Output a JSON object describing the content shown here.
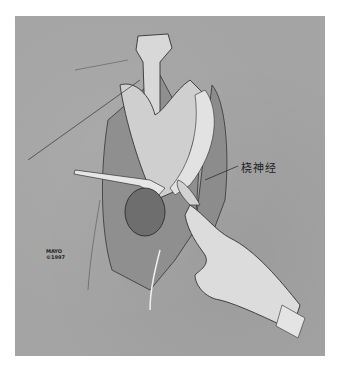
{
  "illustration": {
    "subject": "surgical exposure drawing with retractor and hand",
    "background_color": "#a4a4a4",
    "annotation_label": "桡神经",
    "stamp": {
      "line1": "MAYO",
      "line2": "©1997"
    }
  }
}
